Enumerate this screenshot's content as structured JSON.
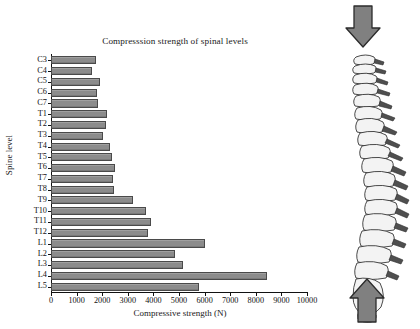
{
  "chart_data": {
    "type": "bar",
    "orientation": "horizontal",
    "title": "Compresssion strength of spinal levels",
    "xlabel": "Compressive strength (N)",
    "ylabel": "Spine level",
    "categories": [
      "C3",
      "C4",
      "C5",
      "C6",
      "C7",
      "T1",
      "T2",
      "T3",
      "T4",
      "T5",
      "T6",
      "T7",
      "T8",
      "T9",
      "T10",
      "T11",
      "T12",
      "L1",
      "L2",
      "L3",
      "L4",
      "L5"
    ],
    "values": [
      1750,
      1600,
      1900,
      1800,
      1820,
      2180,
      2150,
      2050,
      2300,
      2400,
      2500,
      2420,
      2480,
      3200,
      3700,
      3900,
      3800,
      6000,
      4850,
      5150,
      8450,
      5800
    ],
    "xlim": [
      0,
      10000
    ],
    "xticks": [
      0,
      1000,
      2000,
      3000,
      4000,
      5000,
      6000,
      7000,
      8000,
      9000,
      10000
    ],
    "xtick_labels": [
      "0",
      "1000",
      "2000",
      "3000",
      "4000",
      "5000",
      "6000",
      "7000",
      "8000",
      "9000",
      "10000"
    ],
    "grid": false,
    "legend": null,
    "bar_color": "#8c8c8c",
    "bar_edge_color": "#4a4a4a",
    "axis_color": "#111111"
  },
  "illustration": {
    "name": "lateral-spine-diagram",
    "top_arrow": "downward-compression-arrow",
    "bottom_arrow": "upward-compression-arrow",
    "arrow_color": "#808080",
    "arrow_edge_color": "#2b2b2b"
  }
}
